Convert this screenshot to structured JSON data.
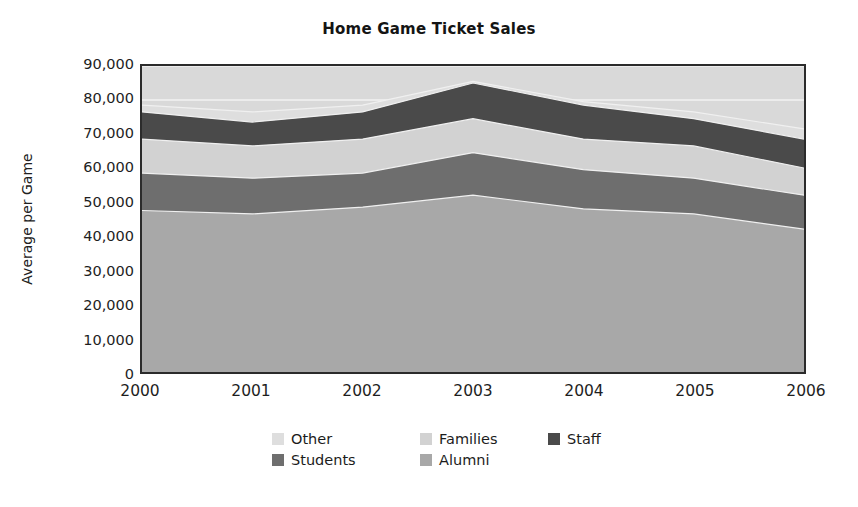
{
  "chart_data": {
    "type": "area",
    "stacked": true,
    "title": "Home Game Ticket Sales",
    "xlabel": "",
    "ylabel": "Average per Game",
    "categories": [
      "2000",
      "2001",
      "2002",
      "2003",
      "2004",
      "2005",
      "2006"
    ],
    "x": [
      2000,
      2001,
      2002,
      2003,
      2004,
      2005,
      2006
    ],
    "ylim": [
      0,
      90000
    ],
    "ytick_values": [
      0,
      10000,
      20000,
      30000,
      40000,
      50000,
      60000,
      70000,
      80000,
      90000
    ],
    "ytick_labels": [
      "0",
      "10,000",
      "20,000",
      "30,000",
      "40,000",
      "50,000",
      "60,000",
      "70,000",
      "80,000",
      "90,000"
    ],
    "grid": true,
    "grid_color": "#f2f2f2",
    "plot_background": "#d9d9d9",
    "legend_position": "bottom",
    "series": [
      {
        "name": "Alumni",
        "color": "#a8a8a8",
        "stack_order": 1,
        "values": [
          47500,
          46500,
          48500,
          52000,
          48000,
          46500,
          42000
        ]
      },
      {
        "name": "Students",
        "color": "#6e6e6e",
        "stack_order": 2,
        "values": [
          11000,
          10500,
          10000,
          12500,
          11500,
          10500,
          10000
        ]
      },
      {
        "name": "Families",
        "color": "#d2d2d2",
        "stack_order": 3,
        "values": [
          10000,
          9500,
          10000,
          10000,
          9000,
          9500,
          8000
        ]
      },
      {
        "name": "Staff",
        "color": "#4a4a4a",
        "stack_order": 4,
        "values": [
          8000,
          7000,
          8000,
          10500,
          10000,
          8000,
          8500
        ]
      },
      {
        "name": "Other",
        "color": "#dedede",
        "stack_order": 5,
        "values": [
          2000,
          3000,
          2000,
          500,
          1000,
          2000,
          3000
        ]
      }
    ],
    "cumulative": {
      "Alumni": [
        47500,
        46500,
        48500,
        52000,
        48000,
        46500,
        42000
      ],
      "Students": [
        58500,
        57000,
        58500,
        64500,
        59500,
        57000,
        52000
      ],
      "Families": [
        68500,
        66500,
        68500,
        74500,
        68500,
        66500,
        60000
      ],
      "Staff": [
        76500,
        73500,
        76500,
        85000,
        78500,
        74500,
        68500
      ],
      "Other": [
        78500,
        76500,
        78500,
        85500,
        79500,
        76500,
        71500
      ]
    },
    "legend_entries": [
      {
        "label": "Other",
        "color": "#dedede"
      },
      {
        "label": "Families",
        "color": "#d2d2d2"
      },
      {
        "label": "Staff",
        "color": "#4a4a4a"
      },
      {
        "label": "Students",
        "color": "#6e6e6e"
      },
      {
        "label": "Alumni",
        "color": "#a8a8a8"
      }
    ]
  }
}
